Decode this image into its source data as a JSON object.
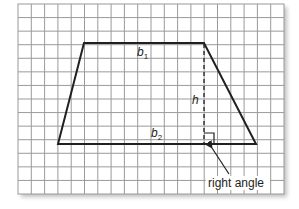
{
  "diagram": {
    "type": "trapezoid-on-grid",
    "grid": {
      "columns": 20,
      "rows": 14,
      "line_color": "#9a9a9a",
      "background": "#ffffff",
      "shadow_color": "#d0d0d0"
    },
    "shape": {
      "name": "trapezoid",
      "stroke_color": "#231f20",
      "vertices": {
        "top_left": [
          84,
          43
        ],
        "top_right": [
          204,
          43
        ],
        "bottom_right": [
          256,
          144
        ],
        "bottom_left": [
          58,
          144
        ]
      }
    },
    "labels": {
      "top_base": "b",
      "top_base_sub": "1",
      "bottom_base": "b",
      "bottom_base_sub": "2",
      "height": "h",
      "callout": "right angle"
    },
    "height_segment": {
      "style": "dashed",
      "x": 204,
      "y_top": 43,
      "y_bottom": 144
    },
    "right_angle_marker": {
      "x": 204,
      "y": 133,
      "size": 10
    }
  }
}
